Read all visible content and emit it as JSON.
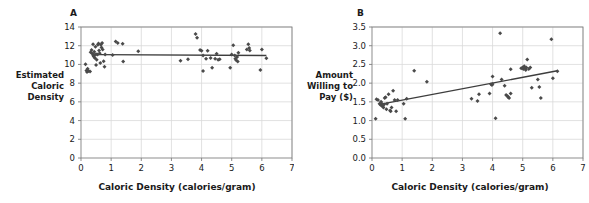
{
  "figure": {
    "panels": [
      "A",
      "B"
    ],
    "marker_color": "#4a4a4a",
    "line_color": "#3d3d3d",
    "grid_color": "#d9d9d9",
    "axis_color": "#808080",
    "background": "#ffffff"
  },
  "panelA": {
    "letter": "A",
    "ytitle": "Estimated\nCaloric\nDensity",
    "xtitle": "Caloric Density (calories/gram)"
  },
  "panelB": {
    "letter": "B",
    "ytitle": "Amount\nWilling to\nPay ($)",
    "xtitle": "Caloric Density (calories/gram)"
  },
  "chart_data": [
    {
      "type": "scatter",
      "panel": "A",
      "title": "",
      "xlabel": "Caloric Density (calories/gram)",
      "ylabel": "Estimated Caloric Density",
      "xlim": [
        0,
        7
      ],
      "ylim": [
        0,
        14
      ],
      "xticks": [
        0,
        1,
        2,
        3,
        4,
        5,
        6,
        7
      ],
      "yticks": [
        0,
        2,
        4,
        6,
        8,
        10,
        12,
        14
      ],
      "xticklabels": [
        "0",
        "1",
        "2",
        "3",
        "4",
        "5",
        "6",
        "7"
      ],
      "yticklabels": [
        "0",
        "2",
        "4",
        "6",
        "8",
        "10",
        "12",
        "14"
      ],
      "grid": true,
      "legend": "none",
      "marker": "diamond",
      "trendline": {
        "x": [
          0.55,
          6.15
        ],
        "y": [
          11.05,
          10.95
        ],
        "slope": -0.018,
        "intercept": 11.06
      },
      "points": [
        [
          0.15,
          10.02
        ],
        [
          0.18,
          9.35
        ],
        [
          0.2,
          9.2
        ],
        [
          0.22,
          9.55
        ],
        [
          0.25,
          9.3
        ],
        [
          0.3,
          9.25
        ],
        [
          0.32,
          11.3
        ],
        [
          0.35,
          11.55
        ],
        [
          0.38,
          11.15
        ],
        [
          0.4,
          11.0
        ],
        [
          0.4,
          12.15
        ],
        [
          0.42,
          10.85
        ],
        [
          0.44,
          11.35
        ],
        [
          0.45,
          11.0
        ],
        [
          0.46,
          10.7
        ],
        [
          0.48,
          11.9
        ],
        [
          0.5,
          11.1
        ],
        [
          0.5,
          9.95
        ],
        [
          0.52,
          10.5
        ],
        [
          0.55,
          11.05
        ],
        [
          0.56,
          12.1
        ],
        [
          0.58,
          12.25
        ],
        [
          0.6,
          11.5
        ],
        [
          0.62,
          11.2
        ],
        [
          0.64,
          10.15
        ],
        [
          0.66,
          12.1
        ],
        [
          0.68,
          11.8
        ],
        [
          0.7,
          12.3
        ],
        [
          0.72,
          11.6
        ],
        [
          0.75,
          10.35
        ],
        [
          0.78,
          9.75
        ],
        [
          0.8,
          11.05
        ],
        [
          1.05,
          11.02
        ],
        [
          1.15,
          12.45
        ],
        [
          1.22,
          12.3
        ],
        [
          1.38,
          12.2
        ],
        [
          1.4,
          10.3
        ],
        [
          1.9,
          11.4
        ],
        [
          3.3,
          10.4
        ],
        [
          3.55,
          10.55
        ],
        [
          3.8,
          13.25
        ],
        [
          3.85,
          12.85
        ],
        [
          3.95,
          11.55
        ],
        [
          4.0,
          11.45
        ],
        [
          4.05,
          10.95
        ],
        [
          4.05,
          9.3
        ],
        [
          4.15,
          10.6
        ],
        [
          4.2,
          11.45
        ],
        [
          4.3,
          10.7
        ],
        [
          4.35,
          9.65
        ],
        [
          4.45,
          10.6
        ],
        [
          4.5,
          11.15
        ],
        [
          4.55,
          10.5
        ],
        [
          4.6,
          10.55
        ],
        [
          4.95,
          9.65
        ],
        [
          5.0,
          11.05
        ],
        [
          5.05,
          12.05
        ],
        [
          5.1,
          10.95
        ],
        [
          5.12,
          10.6
        ],
        [
          5.15,
          10.45
        ],
        [
          5.18,
          10.8
        ],
        [
          5.2,
          10.3
        ],
        [
          5.22,
          11.25
        ],
        [
          5.5,
          11.6
        ],
        [
          5.55,
          12.15
        ],
        [
          5.58,
          11.75
        ],
        [
          5.6,
          11.5
        ],
        [
          5.95,
          9.4
        ],
        [
          6.0,
          11.6
        ],
        [
          6.15,
          10.65
        ]
      ]
    },
    {
      "type": "scatter",
      "panel": "B",
      "title": "",
      "xlabel": "Caloric Density (calories/gram)",
      "ylabel": "Amount Willing to Pay ($)",
      "xlim": [
        0,
        7
      ],
      "ylim": [
        0.0,
        3.5
      ],
      "xticks": [
        0,
        1,
        2,
        3,
        4,
        5,
        6,
        7
      ],
      "yticks": [
        0.0,
        0.5,
        1.0,
        1.5,
        2.0,
        2.5,
        3.0,
        3.5
      ],
      "xticklabels": [
        "0",
        "1",
        "2",
        "3",
        "4",
        "5",
        "6",
        "7"
      ],
      "yticklabels": [
        "0.0",
        "0.5",
        "1.0",
        "1.5",
        "2.0",
        "2.5",
        "3.0",
        "3.5"
      ],
      "grid": true,
      "legend": "none",
      "marker": "diamond",
      "trendline": {
        "x": [
          0.3,
          6.15
        ],
        "y": [
          1.44,
          2.33
        ],
        "slope": 0.152,
        "intercept": 1.394
      },
      "points": [
        [
          0.12,
          1.05
        ],
        [
          0.15,
          1.57
        ],
        [
          0.2,
          1.55
        ],
        [
          0.25,
          1.45
        ],
        [
          0.28,
          1.42
        ],
        [
          0.3,
          1.5
        ],
        [
          0.32,
          1.4
        ],
        [
          0.34,
          1.44
        ],
        [
          0.35,
          1.38
        ],
        [
          0.36,
          1.42
        ],
        [
          0.38,
          1.35
        ],
        [
          0.4,
          1.43
        ],
        [
          0.42,
          1.6
        ],
        [
          0.45,
          1.62
        ],
        [
          0.48,
          1.3
        ],
        [
          0.5,
          1.45
        ],
        [
          0.55,
          1.7
        ],
        [
          0.6,
          1.27
        ],
        [
          0.62,
          1.25
        ],
        [
          0.65,
          1.35
        ],
        [
          0.7,
          1.8
        ],
        [
          0.75,
          1.55
        ],
        [
          0.8,
          1.25
        ],
        [
          0.85,
          1.55
        ],
        [
          1.05,
          1.45
        ],
        [
          1.1,
          1.05
        ],
        [
          1.15,
          1.58
        ],
        [
          1.4,
          2.33
        ],
        [
          1.82,
          2.04
        ],
        [
          3.3,
          1.58
        ],
        [
          3.5,
          1.52
        ],
        [
          3.55,
          1.7
        ],
        [
          3.9,
          1.72
        ],
        [
          3.95,
          1.97
        ],
        [
          3.98,
          1.95
        ],
        [
          4.0,
          2.18
        ],
        [
          4.0,
          1.98
        ],
        [
          4.1,
          1.06
        ],
        [
          4.25,
          3.33
        ],
        [
          4.3,
          2.1
        ],
        [
          4.4,
          1.93
        ],
        [
          4.45,
          1.68
        ],
        [
          4.5,
          1.65
        ],
        [
          4.52,
          1.62
        ],
        [
          4.55,
          1.6
        ],
        [
          4.6,
          2.37
        ],
        [
          4.6,
          1.72
        ],
        [
          4.95,
          2.4
        ],
        [
          5.0,
          2.42
        ],
        [
          5.02,
          2.38
        ],
        [
          5.05,
          2.45
        ],
        [
          5.08,
          2.4
        ],
        [
          5.1,
          2.35
        ],
        [
          5.12,
          2.42
        ],
        [
          5.15,
          2.63
        ],
        [
          5.2,
          2.38
        ],
        [
          5.25,
          2.42
        ],
        [
          5.3,
          1.88
        ],
        [
          5.5,
          2.1
        ],
        [
          5.55,
          1.9
        ],
        [
          5.6,
          1.6
        ],
        [
          5.95,
          3.17
        ],
        [
          6.0,
          2.13
        ],
        [
          6.15,
          2.32
        ]
      ]
    }
  ]
}
